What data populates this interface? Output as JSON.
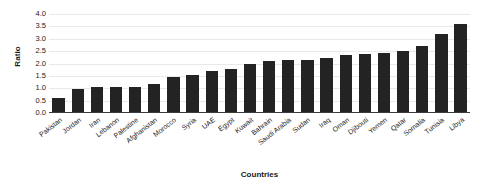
{
  "chart_data": {
    "type": "bar",
    "title": "",
    "xlabel": "Countries",
    "ylabel": "Ratio",
    "ylim": [
      0.0,
      4.0
    ],
    "yticks": [
      "4.0",
      "3.5",
      "3.0",
      "2.5",
      "2.0",
      "1.5",
      "1.0",
      "0.5",
      "0.0"
    ],
    "ytick_values": [
      4.0,
      3.5,
      3.0,
      2.5,
      2.0,
      1.5,
      1.0,
      0.5,
      0.0
    ],
    "grid": true,
    "legend": "none",
    "bar_color": "#232323",
    "grid_color": "#e9e9ec",
    "axis_color": "#3c3c3c",
    "categories": [
      "Pakistan",
      "Jordan",
      "Iran",
      "Lebanon",
      "Palestine",
      "Afghanistan",
      "Morocco",
      "Syria",
      "UAE",
      "Egypt",
      "Kuwait",
      "Bahrain",
      "Saudi Arabia",
      "Sudan",
      "Iraq",
      "Oman",
      "Djibouti",
      "Yemen",
      "Qatar",
      "Somalia",
      "Tunisia",
      "Libya"
    ],
    "values": [
      0.55,
      0.95,
      1.0,
      1.0,
      1.0,
      1.15,
      1.4,
      1.5,
      1.65,
      1.75,
      1.95,
      2.05,
      2.1,
      2.1,
      2.2,
      2.3,
      2.35,
      2.4,
      2.45,
      2.65,
      3.15,
      3.55
    ]
  }
}
